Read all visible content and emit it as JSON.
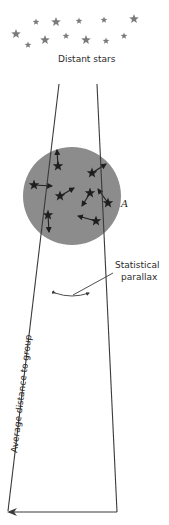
{
  "diagram": {
    "title_label": "Distant stars",
    "cluster_label": "A",
    "parallax_label_line1": "Statistical",
    "parallax_label_line2": "parallax",
    "distance_label": "Average distance to group"
  },
  "colors": {
    "background": "#ffffff",
    "cluster_fill": "#8c8c8c",
    "line": "#3a3a3a",
    "distant_star": "#7a7a7a",
    "cluster_star": "#1e1e1e",
    "text": "#2b2b2b"
  },
  "distant_stars": [
    {
      "x": 36,
      "y": 22,
      "r": 3.5
    },
    {
      "x": 56,
      "y": 22,
      "r": 5
    },
    {
      "x": 16,
      "y": 34,
      "r": 5
    },
    {
      "x": 28,
      "y": 45,
      "r": 3.5
    },
    {
      "x": 45,
      "y": 40,
      "r": 5
    },
    {
      "x": 66,
      "y": 36,
      "r": 3.5
    },
    {
      "x": 79,
      "y": 21,
      "r": 3.5
    },
    {
      "x": 86,
      "y": 40,
      "r": 5
    },
    {
      "x": 104,
      "y": 20,
      "r": 3.5
    },
    {
      "x": 106,
      "y": 41,
      "r": 3.5
    },
    {
      "x": 124,
      "y": 36,
      "r": 3.5
    },
    {
      "x": 134,
      "y": 19,
      "r": 5
    }
  ],
  "cluster_stars": [
    {
      "x": 58,
      "y": 166,
      "ax": 57,
      "ay": 150
    },
    {
      "x": 34,
      "y": 185,
      "ax": 52,
      "ay": 186
    },
    {
      "x": 92,
      "y": 173,
      "ax": 106,
      "ay": 164
    },
    {
      "x": 60,
      "y": 196,
      "ax": 74,
      "ay": 188
    },
    {
      "x": 90,
      "y": 193,
      "ax": 82,
      "ay": 206
    },
    {
      "x": 108,
      "y": 203,
      "ax": 98,
      "ay": 189
    },
    {
      "x": 48,
      "y": 215,
      "ax": 49,
      "ay": 232
    },
    {
      "x": 96,
      "y": 221,
      "ax": 78,
      "ay": 216
    }
  ]
}
